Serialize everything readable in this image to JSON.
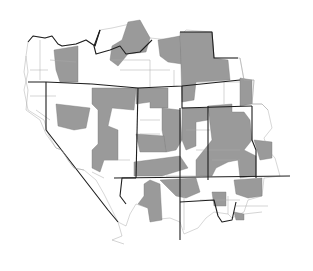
{
  "map": {
    "type": "county choropleth",
    "region": "Western / Mountain United States",
    "colors": {
      "highlighted": "#9a9a9a",
      "not_highlighted": "#ffffff",
      "state_border": "#1e1e1e",
      "county_border": "#a8a8a8"
    },
    "legend": null,
    "labels": []
  }
}
